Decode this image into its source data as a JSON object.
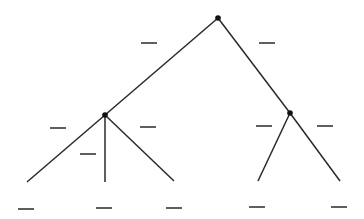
{
  "diagram": {
    "type": "tree",
    "colors": {
      "line": "#2a2a2a",
      "node": "#111111",
      "background": "#ffffff"
    },
    "nodes": [
      {
        "id": "root",
        "x": 218,
        "y": 18,
        "dot": true
      },
      {
        "id": "left",
        "x": 105,
        "y": 115,
        "dot": true
      },
      {
        "id": "right",
        "x": 290,
        "y": 113,
        "dot": true
      },
      {
        "id": "leaf-l1",
        "x": 27,
        "y": 182,
        "dot": false
      },
      {
        "id": "leaf-l2",
        "x": 105,
        "y": 182,
        "dot": false
      },
      {
        "id": "leaf-l3",
        "x": 174,
        "y": 181,
        "dot": false
      },
      {
        "id": "leaf-r1",
        "x": 258,
        "y": 181,
        "dot": false
      },
      {
        "id": "leaf-r2",
        "x": 340,
        "y": 181,
        "dot": false
      }
    ],
    "edges": [
      {
        "from": "root",
        "to": "left"
      },
      {
        "from": "root",
        "to": "right"
      },
      {
        "from": "left",
        "to": "leaf-l1"
      },
      {
        "from": "left",
        "to": "leaf-l2"
      },
      {
        "from": "left",
        "to": "leaf-l3"
      },
      {
        "from": "right",
        "to": "leaf-r1"
      },
      {
        "from": "right",
        "to": "leaf-r2"
      }
    ],
    "blanks": [
      {
        "name": "edge-label-root-left",
        "x1": 141,
        "x2": 157,
        "y": 43
      },
      {
        "name": "edge-label-root-right",
        "x1": 259,
        "x2": 275,
        "y": 43
      },
      {
        "name": "edge-label-left-l1",
        "x1": 50,
        "x2": 66,
        "y": 128
      },
      {
        "name": "edge-label-left-l3",
        "x1": 140,
        "x2": 156,
        "y": 127
      },
      {
        "name": "edge-label-left-l2",
        "x1": 80,
        "x2": 96,
        "y": 154
      },
      {
        "name": "edge-label-right-r1",
        "x1": 256,
        "x2": 272,
        "y": 126
      },
      {
        "name": "edge-label-right-r2",
        "x1": 317,
        "x2": 333,
        "y": 126
      },
      {
        "name": "leaf-label-l1",
        "x1": 18,
        "x2": 34,
        "y": 209
      },
      {
        "name": "leaf-label-l2",
        "x1": 96,
        "x2": 112,
        "y": 208
      },
      {
        "name": "leaf-label-l3",
        "x1": 166,
        "x2": 182,
        "y": 208
      },
      {
        "name": "leaf-label-r1",
        "x1": 249,
        "x2": 265,
        "y": 207
      },
      {
        "name": "leaf-label-r2",
        "x1": 331,
        "x2": 347,
        "y": 207
      }
    ]
  }
}
